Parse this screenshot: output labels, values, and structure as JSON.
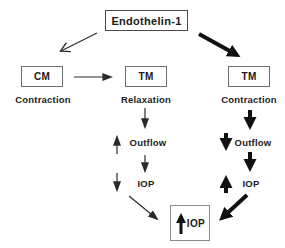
{
  "diagram": {
    "background_color": "#ffffff",
    "ink_color": "#1a1a1a",
    "box_border_color": "#6e6e6e",
    "top_node": {
      "label": "Endothelin-1"
    },
    "left_branch": {
      "box_label": "CM",
      "effect_label": "Contraction"
    },
    "middle_branch": {
      "box_label": "TM",
      "effect_label": "Relaxation",
      "outflow_label": "Outflow",
      "outflow_change": "increase",
      "iop_label": "IOP",
      "iop_change": "decrease"
    },
    "right_branch": {
      "box_label": "TM",
      "effect_label": "Contraction",
      "outflow_label": "Outflow",
      "outflow_change": "decrease",
      "iop_label": "IOP",
      "iop_change": "increase"
    },
    "result_node": {
      "label": "IOP",
      "change": "increase"
    }
  }
}
